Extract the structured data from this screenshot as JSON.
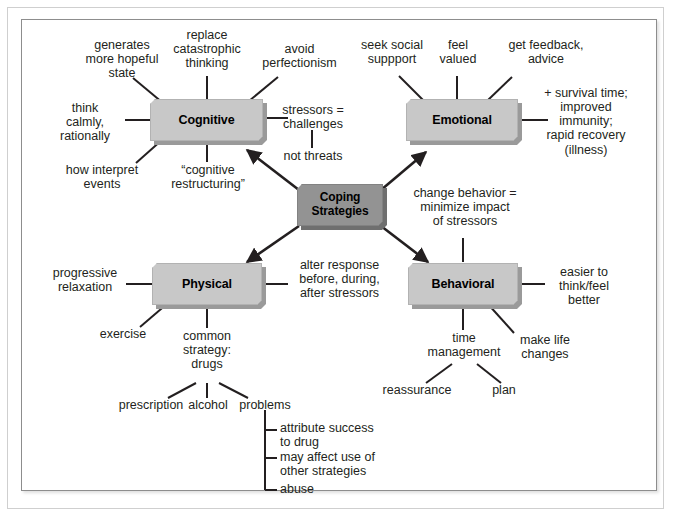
{
  "diagram": {
    "colors": {
      "branch_node_fill": "#c8c8c8",
      "branch_node_shadow": "#9a9a9a",
      "center_node_fill": "#939393",
      "center_node_shadow": "#6f6f6f",
      "text": "#231f20",
      "line": "#231f20",
      "frame_border": "#8d8d8d",
      "background": "#ffffff"
    },
    "center_node": {
      "id": "coping-strategies",
      "label": "Coping\nStrategies"
    },
    "branch_nodes": [
      {
        "id": "cognitive",
        "label": "Cognitive"
      },
      {
        "id": "emotional",
        "label": "Emotional"
      },
      {
        "id": "physical",
        "label": "Physical"
      },
      {
        "id": "behavioral",
        "label": "Behavioral"
      }
    ],
    "cognitive_branch": {
      "node": "Cognitive",
      "leaves": [
        "generates\nmore hopeful\nstate",
        "replace\ncatastrophic\nthinking",
        "avoid\nperfectionism",
        "think\ncalmly,\nrationally",
        "stressors =\nchallenges",
        "not threats",
        "how interpret\nevents",
        "“cognitive\nrestructuring”"
      ]
    },
    "emotional_branch": {
      "node": "Emotional",
      "leaves": [
        "seek social\nsuppport",
        "feel\nvalued",
        "get feedback,\nadvice",
        "+ survival time;\nimproved\nimmunity;\nrapid recovery\n(illness)"
      ]
    },
    "physical_branch": {
      "node": "Physical",
      "leaves": [
        "progressive\nrelaxation",
        "alter response\nbefore, during,\nafter stressors",
        "exercise",
        "common\nstrategy:\ndrugs"
      ],
      "drug_children": [
        "prescription",
        "alcohol",
        "problems"
      ],
      "problem_items": [
        "attribute success\nto drug",
        "may affect use of\nother strategies",
        "abuse"
      ]
    },
    "behavioral_branch": {
      "node": "Behavioral",
      "leaves": [
        "change behavior =\nminimize impact\nof stressors",
        "easier to\nthink/feel\nbetter",
        "time\nmanagement",
        "make life\nchanges"
      ],
      "time_management_children": [
        "reassurance",
        "plan"
      ]
    }
  }
}
